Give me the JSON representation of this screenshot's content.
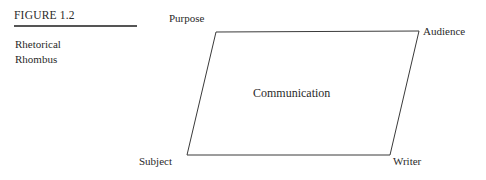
{
  "figure": {
    "number": "FIGURE 1.2",
    "title_line1": "Rhetorical",
    "title_line2": "Rhombus"
  },
  "diagram": {
    "type": "rhetorical-rhombus",
    "shape": "parallelogram",
    "center_label": "Communication",
    "corners": {
      "top_left": "Purpose",
      "top_right": "Audience",
      "bottom_left": "Subject",
      "bottom_right": "Writer"
    },
    "vertices": {
      "top_left": [
        216,
        32
      ],
      "top_right": [
        419,
        31
      ],
      "bottom_right": [
        390,
        155
      ],
      "bottom_left": [
        187,
        155
      ]
    },
    "stroke_color": "#3a3a3a",
    "fill_color": "#ffffff",
    "stroke_width": 1
  },
  "page": {
    "background": "#ffffff",
    "text_color": "#2a2a2a",
    "rule_color": "#555555"
  }
}
